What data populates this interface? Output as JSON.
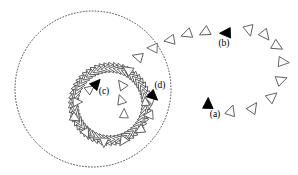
{
  "figure": {
    "background_color": "#ffffff",
    "width": 298,
    "height": 175,
    "stroke_color": "#555555",
    "dark_stroke_color": "#333333",
    "fill_color": "#000000",
    "outline_fill": "#ffffff"
  },
  "labels": [
    {
      "id": "a",
      "text": "(a)",
      "x": 215,
      "y": 117,
      "marker": "filled-triangle-up"
    },
    {
      "id": "b",
      "text": "(b)",
      "x": 224,
      "y": 46,
      "marker": "filled-triangle-left"
    },
    {
      "id": "c",
      "text": "(c)",
      "x": 104,
      "y": 94,
      "marker": "filled-triangle-up-right"
    },
    {
      "id": "d",
      "text": "(d)",
      "x": 160,
      "y": 88,
      "marker": "filled-triangle-down-right"
    }
  ],
  "markers": [
    {
      "id": "marker-a",
      "label": "a",
      "x": 208,
      "y": 104,
      "rotation": -88,
      "size": 10.5,
      "filled": true
    },
    {
      "id": "marker-b",
      "label": "b",
      "x": 226,
      "y": 33,
      "rotation": 178,
      "size": 10.5,
      "filled": true
    },
    {
      "id": "marker-c",
      "label": "c",
      "x": 96,
      "y": 84,
      "rotation": -48,
      "size": 10.0,
      "filled": true
    },
    {
      "id": "marker-d",
      "label": "d",
      "x": 153,
      "y": 96,
      "rotation": 42,
      "size": 10.0,
      "filled": true
    }
  ],
  "outer_circle": {
    "name": "outer-dotted-circle",
    "cx": 93,
    "cy": 89,
    "r": 78,
    "style": "dotted",
    "stroke_width": 0.9,
    "stroke_color": "#3a3a3a",
    "dash": "0.9 2.1"
  },
  "inner_ring": {
    "name": "inner-dense-ring",
    "cx": 110,
    "cy": 104,
    "r": 37,
    "band_count": 54,
    "band_triangle_size": 9.0,
    "stroke_color": "#4a4a4a",
    "description": "dense band of overlapping small triangles forming a closed ring"
  },
  "outer_trajectory": {
    "name": "outer-spiral-arc",
    "description": "open arc of outlined triangles spiralling clockwise from lower-right inward to upper-left",
    "count": 17,
    "triangles": [
      {
        "x": 231,
        "y": 111,
        "rotation": -72,
        "size": 10.2
      },
      {
        "x": 253,
        "y": 108,
        "rotation": -56,
        "size": 10.4
      },
      {
        "x": 272,
        "y": 97,
        "rotation": -40,
        "size": 10.4
      },
      {
        "x": 281,
        "y": 80,
        "rotation": -20,
        "size": 10.2
      },
      {
        "x": 283,
        "y": 62,
        "rotation": 6,
        "size": 10.2
      },
      {
        "x": 277,
        "y": 46,
        "rotation": 30,
        "size": 10.3
      },
      {
        "x": 265,
        "y": 35,
        "rotation": 52,
        "size": 10.3
      },
      {
        "x": 249,
        "y": 30,
        "rotation": 76,
        "size": 10.3
      },
      {
        "x": 205,
        "y": 32,
        "rotation": 152,
        "size": 10.1
      },
      {
        "x": 187,
        "y": 34,
        "rotation": 160,
        "size": 10.1
      },
      {
        "x": 170,
        "y": 40,
        "rotation": 170,
        "size": 10.0
      },
      {
        "x": 153,
        "y": 48,
        "rotation": 182,
        "size": 10.0
      },
      {
        "x": 138,
        "y": 57,
        "rotation": 196,
        "size": 9.8
      },
      {
        "x": 128,
        "y": 70,
        "rotation": 214,
        "size": 9.6
      },
      {
        "x": 122,
        "y": 85,
        "rotation": 234,
        "size": 9.4
      },
      {
        "x": 121,
        "y": 100,
        "rotation": 252,
        "size": 9.2
      },
      {
        "x": 124,
        "y": 114,
        "rotation": 272,
        "size": 9.0
      }
    ]
  },
  "inner_trajectory": {
    "name": "inner-approach-arc",
    "description": "outlined triangles orbiting just outside and onto the dense inner ring",
    "count": 9,
    "triangles": [
      {
        "x": 90,
        "y": 89,
        "rotation": -38,
        "size": 9.2
      },
      {
        "x": 77,
        "y": 102,
        "rotation": -2,
        "size": 9.2
      },
      {
        "x": 75,
        "y": 118,
        "rotation": 30,
        "size": 9.2
      },
      {
        "x": 86,
        "y": 133,
        "rotation": 62,
        "size": 9.2
      },
      {
        "x": 104,
        "y": 142,
        "rotation": 92,
        "size": 9.2
      },
      {
        "x": 123,
        "y": 141,
        "rotation": 124,
        "size": 9.2
      },
      {
        "x": 140,
        "y": 130,
        "rotation": 150,
        "size": 9.2
      },
      {
        "x": 149,
        "y": 115,
        "rotation": 176,
        "size": 9.2
      },
      {
        "x": 150,
        "y": 99,
        "rotation": 200,
        "size": 9.2
      }
    ]
  }
}
